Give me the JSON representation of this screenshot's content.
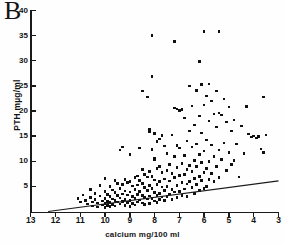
{
  "panel": {
    "label": "B"
  },
  "axes": {
    "ylabel": "PTH mµg/ml",
    "xlabel": "calcium mg/100 ml",
    "yticks": [
      0,
      5,
      10,
      15,
      20,
      25,
      30,
      35,
      40
    ],
    "ytick_labels": [
      "",
      "5",
      "10",
      "15",
      "20",
      "25",
      "30",
      "35",
      "40"
    ],
    "xticks": [
      13,
      12,
      11,
      10,
      9,
      8,
      7,
      6,
      5,
      4,
      3
    ],
    "xtick_labels": [
      "13",
      "12",
      "11",
      "10",
      "9",
      "8",
      "7",
      "6",
      "5",
      "4",
      "3"
    ]
  },
  "chart_data": {
    "type": "scatter",
    "title": "",
    "xlabel": "calcium mg/100 ml",
    "ylabel": "PTH mµg/ml",
    "xlim": [
      13,
      3
    ],
    "ylim": [
      0,
      40
    ],
    "x_axis_reversed": true,
    "grid": false,
    "legend": null,
    "marker": "square",
    "marker_color": "#101010",
    "regression_line": {
      "x_start": 12.3,
      "y_start": 0.0,
      "x_end": 3.0,
      "y_end": 6.1,
      "color": "#1a1a1a"
    },
    "points": [
      [
        11.1,
        2.6
      ],
      [
        11.0,
        1.9
      ],
      [
        10.9,
        3.3
      ],
      [
        10.8,
        2.2
      ],
      [
        10.7,
        1.5
      ],
      [
        10.6,
        4.4
      ],
      [
        10.6,
        2.8
      ],
      [
        10.5,
        1.9
      ],
      [
        10.5,
        1.1
      ],
      [
        10.4,
        3.6
      ],
      [
        10.4,
        2.4
      ],
      [
        10.3,
        1.7
      ],
      [
        10.3,
        0.9
      ],
      [
        10.2,
        5.2
      ],
      [
        10.2,
        3.1
      ],
      [
        10.1,
        2.1
      ],
      [
        10.1,
        1.3
      ],
      [
        10.0,
        6.6
      ],
      [
        10.0,
        4.0
      ],
      [
        10.0,
        2.6
      ],
      [
        10.0,
        1.6
      ],
      [
        10.0,
        0.8
      ],
      [
        9.9,
        3.4
      ],
      [
        9.9,
        2.0
      ],
      [
        9.9,
        1.2
      ],
      [
        9.8,
        5.0
      ],
      [
        9.8,
        3.0
      ],
      [
        9.8,
        1.8
      ],
      [
        9.8,
        1.0
      ],
      [
        9.7,
        4.3
      ],
      [
        9.7,
        2.5
      ],
      [
        9.7,
        1.4
      ],
      [
        9.6,
        6.2
      ],
      [
        9.6,
        3.8
      ],
      [
        9.6,
        2.2
      ],
      [
        9.6,
        1.1
      ],
      [
        9.5,
        5.6
      ],
      [
        9.5,
        3.2
      ],
      [
        9.5,
        1.9
      ],
      [
        9.4,
        12.2
      ],
      [
        9.4,
        4.6
      ],
      [
        9.4,
        2.7
      ],
      [
        9.4,
        1.5
      ],
      [
        9.3,
        12.8
      ],
      [
        9.3,
        5.4
      ],
      [
        9.3,
        3.5
      ],
      [
        9.3,
        2.0
      ],
      [
        9.2,
        6.4
      ],
      [
        9.2,
        4.1
      ],
      [
        9.2,
        2.4
      ],
      [
        9.2,
        1.2
      ],
      [
        9.1,
        5.8
      ],
      [
        9.1,
        3.3
      ],
      [
        9.1,
        1.8
      ],
      [
        9.0,
        11.3
      ],
      [
        9.0,
        6.0
      ],
      [
        9.0,
        3.9
      ],
      [
        9.0,
        2.2
      ],
      [
        9.0,
        1.0
      ],
      [
        8.9,
        5.1
      ],
      [
        8.9,
        3.0
      ],
      [
        8.9,
        1.6
      ],
      [
        8.8,
        6.8
      ],
      [
        8.8,
        4.4
      ],
      [
        8.8,
        2.6
      ],
      [
        8.8,
        1.3
      ],
      [
        8.7,
        7.1
      ],
      [
        8.7,
        5.3
      ],
      [
        8.7,
        3.4
      ],
      [
        8.7,
        1.9
      ],
      [
        8.6,
        12.6
      ],
      [
        8.6,
        6.2
      ],
      [
        8.6,
        4.0
      ],
      [
        8.6,
        2.3
      ],
      [
        8.5,
        24.0
      ],
      [
        8.5,
        8.3
      ],
      [
        8.5,
        5.6
      ],
      [
        8.5,
        3.2
      ],
      [
        8.5,
        1.7
      ],
      [
        8.4,
        7.4
      ],
      [
        8.4,
        4.8
      ],
      [
        8.4,
        2.8
      ],
      [
        8.4,
        1.4
      ],
      [
        8.3,
        22.8
      ],
      [
        8.3,
        6.9
      ],
      [
        8.3,
        4.2
      ],
      [
        8.3,
        2.5
      ],
      [
        8.2,
        16.3
      ],
      [
        8.2,
        15.9
      ],
      [
        8.2,
        8.0
      ],
      [
        8.2,
        5.2
      ],
      [
        8.2,
        3.1
      ],
      [
        8.2,
        1.6
      ],
      [
        8.1,
        35.0
      ],
      [
        8.1,
        26.9
      ],
      [
        8.1,
        12.3
      ],
      [
        8.1,
        7.0
      ],
      [
        8.1,
        4.6
      ],
      [
        8.1,
        2.6
      ],
      [
        8.0,
        15.5
      ],
      [
        8.0,
        10.6
      ],
      [
        8.0,
        10.4
      ],
      [
        8.0,
        6.3
      ],
      [
        8.0,
        3.8
      ],
      [
        8.0,
        2.1
      ],
      [
        7.9,
        13.9
      ],
      [
        7.9,
        8.6
      ],
      [
        7.9,
        5.4
      ],
      [
        7.9,
        3.2
      ],
      [
        7.9,
        1.8
      ],
      [
        7.8,
        14.4
      ],
      [
        7.8,
        9.0
      ],
      [
        7.8,
        6.0
      ],
      [
        7.8,
        3.6
      ],
      [
        7.8,
        2.4
      ],
      [
        7.7,
        15.1
      ],
      [
        7.7,
        7.8
      ],
      [
        7.7,
        4.9
      ],
      [
        7.7,
        2.9
      ],
      [
        7.6,
        13.0
      ],
      [
        7.6,
        6.5
      ],
      [
        7.6,
        4.2
      ],
      [
        7.6,
        2.2
      ],
      [
        7.5,
        11.6
      ],
      [
        7.5,
        8.2
      ],
      [
        7.5,
        5.0
      ],
      [
        7.5,
        3.0
      ],
      [
        7.4,
        9.4
      ],
      [
        7.4,
        6.1
      ],
      [
        7.4,
        3.5
      ],
      [
        7.3,
        15.2
      ],
      [
        7.3,
        7.6
      ],
      [
        7.3,
        4.4
      ],
      [
        7.3,
        2.4
      ],
      [
        7.2,
        33.8
      ],
      [
        7.2,
        20.6
      ],
      [
        7.2,
        10.9
      ],
      [
        7.2,
        6.8
      ],
      [
        7.2,
        3.9
      ],
      [
        7.1,
        20.4
      ],
      [
        7.1,
        13.1
      ],
      [
        7.1,
        8.8
      ],
      [
        7.1,
        5.2
      ],
      [
        7.1,
        2.8
      ],
      [
        7.0,
        20.1
      ],
      [
        7.0,
        12.6
      ],
      [
        7.0,
        7.2
      ],
      [
        7.0,
        4.0
      ],
      [
        6.9,
        20.3
      ],
      [
        6.9,
        9.6
      ],
      [
        6.9,
        5.8
      ],
      [
        6.9,
        3.2
      ],
      [
        6.8,
        18.6
      ],
      [
        6.8,
        11.1
      ],
      [
        6.8,
        7.4
      ],
      [
        6.8,
        4.5
      ],
      [
        6.7,
        14.0
      ],
      [
        6.7,
        8.4
      ],
      [
        6.7,
        5.5
      ],
      [
        6.7,
        3.0
      ],
      [
        6.6,
        25.0
      ],
      [
        6.6,
        16.0
      ],
      [
        6.6,
        9.2
      ],
      [
        6.6,
        6.0
      ],
      [
        6.5,
        21.0
      ],
      [
        6.5,
        12.8
      ],
      [
        6.5,
        8.0
      ],
      [
        6.5,
        4.8
      ],
      [
        6.4,
        17.2
      ],
      [
        6.4,
        10.2
      ],
      [
        6.4,
        6.6
      ],
      [
        6.4,
        3.6
      ],
      [
        6.3,
        24.1
      ],
      [
        6.3,
        13.4
      ],
      [
        6.3,
        8.9
      ],
      [
        6.3,
        5.4
      ],
      [
        6.2,
        29.9
      ],
      [
        6.2,
        19.0
      ],
      [
        6.2,
        11.4
      ],
      [
        6.2,
        7.0
      ],
      [
        6.2,
        4.2
      ],
      [
        6.1,
        25.3
      ],
      [
        6.1,
        15.6
      ],
      [
        6.1,
        9.8
      ],
      [
        6.1,
        6.2
      ],
      [
        6.0,
        35.8
      ],
      [
        6.0,
        21.2
      ],
      [
        6.0,
        12.0
      ],
      [
        6.0,
        7.8
      ],
      [
        6.0,
        4.6
      ],
      [
        5.9,
        23.0
      ],
      [
        5.9,
        14.2
      ],
      [
        5.9,
        8.6
      ],
      [
        5.9,
        5.0
      ],
      [
        5.8,
        25.4
      ],
      [
        5.8,
        18.0
      ],
      [
        5.8,
        10.0
      ],
      [
        5.8,
        6.4
      ],
      [
        5.7,
        22.0
      ],
      [
        5.7,
        13.2
      ],
      [
        5.7,
        7.6
      ],
      [
        5.6,
        19.4
      ],
      [
        5.6,
        11.0
      ],
      [
        5.6,
        6.0
      ],
      [
        5.5,
        24.0
      ],
      [
        5.5,
        16.8
      ],
      [
        5.5,
        9.0
      ],
      [
        5.4,
        35.8
      ],
      [
        5.4,
        19.6
      ],
      [
        5.4,
        12.2
      ],
      [
        5.4,
        6.8
      ],
      [
        5.3,
        19.2
      ],
      [
        5.3,
        10.4
      ],
      [
        5.2,
        22.4
      ],
      [
        5.2,
        13.6
      ],
      [
        5.1,
        17.8
      ],
      [
        5.1,
        8.2
      ],
      [
        5.0,
        20.8
      ],
      [
        5.0,
        11.8
      ],
      [
        4.9,
        16.0
      ],
      [
        4.9,
        9.4
      ],
      [
        4.8,
        18.2
      ],
      [
        4.8,
        10.2
      ],
      [
        4.7,
        13.4
      ],
      [
        4.6,
        6.9
      ],
      [
        4.5,
        17.0
      ],
      [
        4.4,
        11.6
      ],
      [
        4.3,
        20.9
      ],
      [
        4.2,
        15.4
      ],
      [
        4.1,
        14.8
      ],
      [
        4.0,
        15.0
      ],
      [
        3.9,
        14.6
      ],
      [
        3.8,
        14.9
      ],
      [
        3.7,
        12.4
      ],
      [
        3.6,
        22.8
      ],
      [
        3.6,
        11.8
      ],
      [
        3.5,
        15.2
      ]
    ]
  }
}
